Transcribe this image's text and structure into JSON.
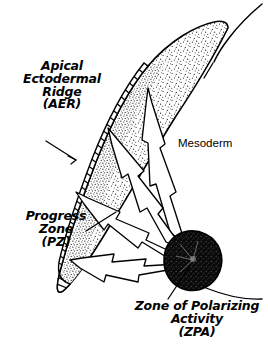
{
  "figure": {
    "background_color": "#ffffff",
    "ink_color": "#000000",
    "width": 268,
    "height": 347
  },
  "labels": {
    "aer": {
      "name": "Apical Ectodermal Ridge",
      "abbreviation": "(AER)",
      "lines": [
        "Apical",
        "Ectodermal",
        "Ridge",
        "(AER)"
      ],
      "text": "Apical\nEctodermal\nRidge\n(AER)",
      "style": "bold-italic",
      "has_leader_line": true
    },
    "pz": {
      "name": "Progress Zone",
      "abbreviation": "(PZ)",
      "lines": [
        "Progress",
        "Zone",
        "(PZ)"
      ],
      "text": "Progress\nZone\n(PZ)",
      "style": "bold-italic",
      "has_leader_line": true
    },
    "zpa": {
      "name": "Zone of Polarizing Activity",
      "abbreviation": "(ZPA)",
      "lines": [
        "Zone of Polarizing",
        "Activity",
        "(ZPA)"
      ],
      "text": "Zone of Polarizing\nActivity\n(ZPA)",
      "style": "bold-italic",
      "has_leader_line": true
    },
    "mesoderm": {
      "name": "Mesoderm",
      "lines": [
        "Mesoderm"
      ],
      "text": "Mesoderm",
      "style": "plain-upright",
      "has_leader_line": false
    }
  },
  "regions": {
    "mesoderm_fill": {
      "label": "stippled mesoderm core",
      "texture": "fine random stipple",
      "color": "#000000"
    },
    "aer_band": {
      "label": "apical ectodermal ridge",
      "texture": "dense perpendicular hatch lines",
      "color": "#000000"
    },
    "zpa_blob": {
      "label": "zone of polarizing activity",
      "texture": "solid dark mottled blob",
      "color": "#111111"
    },
    "body_wall": {
      "label": "body wall contour",
      "texture": "thin outline curve",
      "color": "#000000"
    }
  },
  "arrows": {
    "count": 4,
    "description": "white barbed arrows radiating from the ZPA toward the AER",
    "color": "#ffffff",
    "outline_color": "#000000"
  }
}
